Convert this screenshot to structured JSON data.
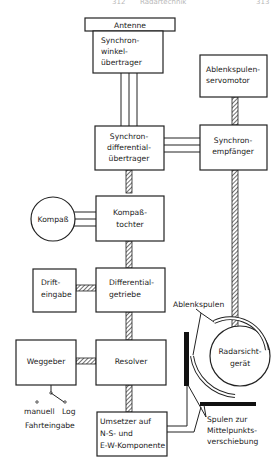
{
  "header": {
    "left": "312",
    "center": "Radartechnik",
    "right": "313"
  },
  "blocks": {
    "antenne": "Antenne",
    "synchronwinkel": [
      "Synchron-",
      "winkel-",
      "übertrager"
    ],
    "ablenk_servo": [
      "Ablenkspulen-",
      "servomotor"
    ],
    "synchrondiff": [
      "Synchron-",
      "differential-",
      "übertrager"
    ],
    "synchronempf": [
      "Synchron-",
      "empfänger"
    ],
    "kompass": "Kompaß",
    "kompasstochter": [
      "Kompaß-",
      "tochter"
    ],
    "drift": [
      "Drift-",
      "eingabe"
    ],
    "diffgetriebe": [
      "Differential-",
      "getriebe"
    ],
    "weggeber": "Weggeber",
    "resolver": "Resolver",
    "umsetzer": [
      "Umsetzer auf",
      "N-S- und",
      "E-W-Komponente"
    ],
    "radar": [
      "Radarsicht-",
      "gerät"
    ]
  },
  "labels": {
    "ablenkspulen": "Ablenkspulen",
    "spulen": [
      "Spulen zur",
      "Mittelpunkts-",
      "verschiebung"
    ],
    "manuell": "manuell",
    "log": "Log",
    "fahrteingabe": "Fahrteingabe"
  }
}
